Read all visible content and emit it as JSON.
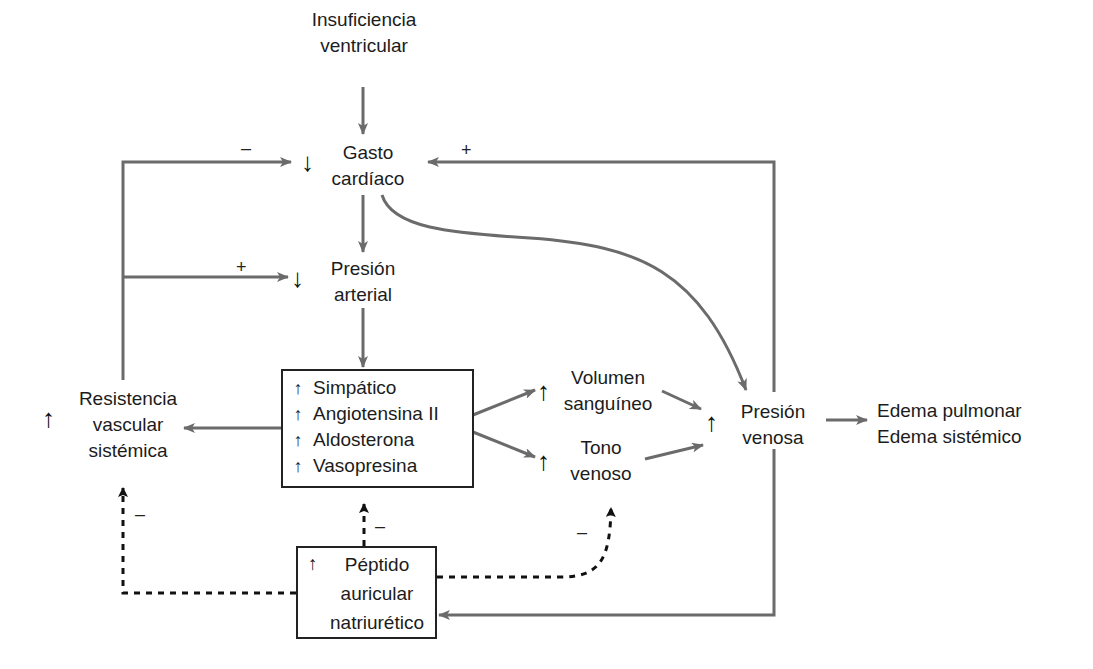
{
  "diagram": {
    "colors": {
      "arrow": "#6b6b6b",
      "text": "#1c1c1c",
      "dashed": "#111111",
      "background": "#ffffff"
    },
    "nodes": {
      "insuficiencia": {
        "lines": [
          "Insuficiencia",
          "ventricular"
        ]
      },
      "gasto": {
        "indicator": "↓",
        "lines": [
          "Gasto",
          "cardíaco"
        ]
      },
      "presion_arterial": {
        "indicator": "↓",
        "lines": [
          "Presión",
          "arterial"
        ]
      },
      "resistencia": {
        "indicator": "↑",
        "lines": [
          "Resistencia",
          "vascular",
          "sistémica"
        ]
      },
      "neurohumoral_box": {
        "items": [
          {
            "indicator": "↑",
            "label": "Simpático"
          },
          {
            "indicator": "↑",
            "label": "Angiotensina II"
          },
          {
            "indicator": "↑",
            "label": "Aldosterona"
          },
          {
            "indicator": "↑",
            "label": "Vasopresina"
          }
        ]
      },
      "volumen": {
        "indicator": "↑",
        "lines": [
          "Volumen",
          "sanguíneo"
        ]
      },
      "tono": {
        "indicator": "↑",
        "lines": [
          "Tono",
          "venoso"
        ]
      },
      "presion_venosa": {
        "indicator": "↑",
        "lines": [
          "Presión",
          "venosa"
        ]
      },
      "edema": {
        "lines": [
          "Edema pulmonar",
          "Edema sistémico"
        ]
      },
      "peptido_box": {
        "indicator": "↑",
        "lines": [
          "Péptido",
          "auricular",
          "natriurético"
        ]
      }
    },
    "signs": {
      "resistencia_to_gasto": "–",
      "venosa_to_gasto": "+",
      "resistencia_to_arterial": "+",
      "anp_to_resistencia": "–",
      "anp_to_box": "–",
      "anp_to_tono": "–"
    }
  }
}
